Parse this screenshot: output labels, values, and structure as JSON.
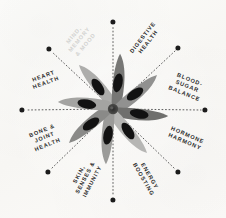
{
  "graphic": {
    "title": "Star anise radial benefits wheel",
    "background_color": "#fbfbf8",
    "center_icon": "star-anise-flower-icon",
    "dot_color": "#1c1c1c",
    "spoke_style": "dotted",
    "spoke_color": "#4a4a4a",
    "label_color": "#2b2b2b",
    "faint_label_color": "#d2d2d0"
  },
  "center": {
    "petal_light": "#b9b9b7",
    "petal_mid": "#8d8d8b",
    "petal_dark": "#6e6e6c",
    "seed_color": "#121212",
    "petal_count": 8
  },
  "spokes": [
    {
      "id": "mind-memory-mood",
      "label": "MIND,\nMEMORY\n& MOOD",
      "angle_deg": 315,
      "faint": true,
      "dot": {
        "x": 49,
        "y": 49
      },
      "label_pos": {
        "x": 80,
        "y": 40
      },
      "label_rotation": -50
    },
    {
      "id": "digestive-health",
      "label": "DIGESTIVE\nHEALTH",
      "angle_deg": 340,
      "faint": false,
      "dot": {
        "x": 113,
        "y": 22
      },
      "label_pos": {
        "x": 146,
        "y": 40
      },
      "label_rotation": -52
    },
    {
      "id": "blood-sugar-balance",
      "label": "BLOOD-\nSUGAR\nBALANCE",
      "angle_deg": 20,
      "faint": false,
      "dot": {
        "x": 178,
        "y": 48
      },
      "label_pos": {
        "x": 187,
        "y": 87
      },
      "label_rotation": 22
    },
    {
      "id": "hormone-harmony",
      "label": "HORMONE\nHARMONY",
      "angle_deg": 45,
      "faint": false,
      "dot": {
        "x": 205,
        "y": 110
      },
      "label_pos": {
        "x": 186,
        "y": 139
      },
      "label_rotation": 23
    },
    {
      "id": "energy-boosting",
      "label": "ENERGY\nBOOSTING",
      "angle_deg": 70,
      "faint": false,
      "dot": {
        "x": 178,
        "y": 172
      },
      "label_pos": {
        "x": 146,
        "y": 178
      },
      "label_rotation": 60
    },
    {
      "id": "skin-senses-immunity",
      "label": "SKIN,\nSENSES &\nIMMUNITY",
      "angle_deg": 110,
      "faint": false,
      "dot": {
        "x": 113,
        "y": 200
      },
      "label_pos": {
        "x": 86,
        "y": 178
      },
      "label_rotation": -62
    },
    {
      "id": "bone-joint-health",
      "label": "BONE &\nJOINT\nHEALTH",
      "angle_deg": 200,
      "faint": false,
      "dot": {
        "x": 48,
        "y": 172
      },
      "label_pos": {
        "x": 45,
        "y": 138
      },
      "label_rotation": -22
    },
    {
      "id": "heart-health",
      "label": "HEART\nHEALTH",
      "angle_deg": 250,
      "faint": false,
      "dot": {
        "x": 22,
        "y": 110
      },
      "label_pos": {
        "x": 45,
        "y": 80
      },
      "label_rotation": -20
    }
  ]
}
